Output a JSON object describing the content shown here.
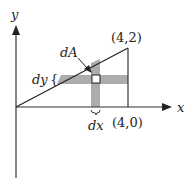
{
  "diagram": {
    "type": "double-integral-region",
    "axes": {
      "x_label": "x",
      "y_label": "y"
    },
    "points": {
      "top_vertex": "(4,2)",
      "bottom_vertex": "(4,0)"
    },
    "annotations": {
      "area_element": "dA",
      "dy_label": "dy",
      "dy_brace": "{",
      "dx_label": "dx"
    },
    "colors": {
      "line": "#222222",
      "strip_fill": "#9e9e9e",
      "background": "#ffffff"
    }
  }
}
